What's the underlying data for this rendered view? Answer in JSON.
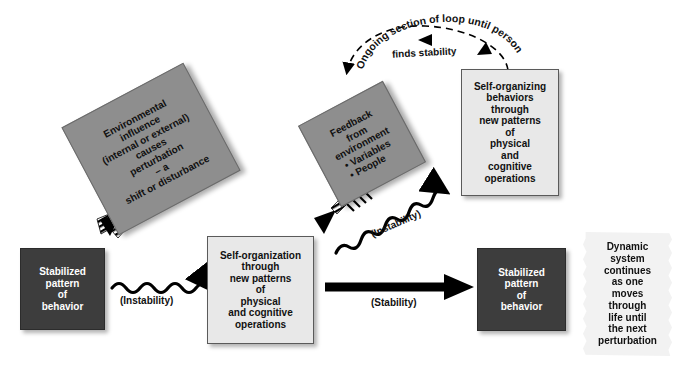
{
  "diagram": {
    "colors": {
      "dark_box": "#3d3d3d",
      "mid_box": "#8e8e8e",
      "light_box": "#e8e8e8",
      "note": "#f2f2f2",
      "line": "#000000"
    },
    "boxes": {
      "environmental": {
        "name": "environmental-influence-box",
        "lines": [
          "Environmental",
          "influence",
          "(internal or external)",
          "causes",
          "perturbation",
          "– a",
          "shift or disturbance"
        ]
      },
      "feedback": {
        "name": "feedback-box",
        "lines": [
          "Feedback",
          "from",
          "environment"
        ],
        "bullets": [
          "Variables",
          "People"
        ]
      },
      "self_organizing": {
        "name": "self-organizing-behaviors-box",
        "lines": [
          "Self-organizing",
          "behaviors",
          "through",
          "new patterns",
          "of",
          "physical",
          "and",
          "cognitive",
          "operations"
        ]
      },
      "stabilized_left": {
        "name": "stabilized-pattern-left-box",
        "lines": [
          "Stabilized",
          "pattern",
          "of",
          "behavior"
        ]
      },
      "self_organization": {
        "name": "self-organization-box",
        "lines": [
          "Self-organization",
          "through",
          "new patterns",
          "of",
          "physical",
          "and cognitive",
          "operations"
        ]
      },
      "stabilized_right": {
        "name": "stabilized-pattern-right-box",
        "lines": [
          "Stabilized",
          "pattern",
          "of",
          "behavior"
        ]
      },
      "dynamic_note": {
        "name": "dynamic-system-note",
        "lines": [
          "Dynamic",
          "system",
          "continues",
          "as one",
          "moves",
          "through",
          "life until",
          "the next",
          "perturbation"
        ]
      }
    },
    "arrow_labels": {
      "instability_1": "(Instability)",
      "instability_2": "(Instability)",
      "stability": "(Stability)"
    },
    "arc_caption": {
      "line1": "Ongoing section of loop until person",
      "line2": "finds stability"
    }
  }
}
